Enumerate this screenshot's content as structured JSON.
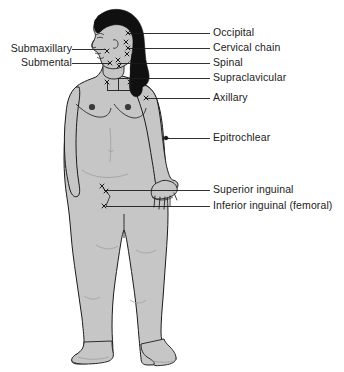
{
  "figure": {
    "background_color": "#ffffff",
    "skin_fill_color": "#c6c6c6",
    "hair_fill_color": "#101010",
    "outline_color": "#1b1b1b",
    "leader_line_color": "#1b1b1b",
    "label_text_color": "#1b1b1b"
  },
  "labels": {
    "right": [
      {
        "text": "Occipital",
        "x": 213,
        "y": 33,
        "line_from_x": 200,
        "line_to_x": 128
      },
      {
        "text": "Cervical chain",
        "x": 213,
        "y": 48,
        "line_from_x": 200,
        "line_to_x": 128
      },
      {
        "text": "Spinal",
        "x": 213,
        "y": 63,
        "line_from_x": 200,
        "line_to_x": 118
      },
      {
        "text": "Supraclavicular",
        "x": 213,
        "y": 78,
        "line_from_x": 200,
        "line_to_x": 107
      },
      {
        "text": "Axillary",
        "x": 213,
        "y": 98,
        "line_from_x": 200,
        "line_to_x": 146
      },
      {
        "text": "Epitrochlear",
        "x": 213,
        "y": 138,
        "line_from_x": 200,
        "line_to_x": 166
      },
      {
        "text": "Superior inguinal",
        "x": 213,
        "y": 190,
        "line_from_x": 200,
        "line_to_x": 102
      },
      {
        "text": "Inferior inguinal (femoral)",
        "x": 213,
        "y": 206,
        "line_from_x": 200,
        "line_to_x": 104
      }
    ],
    "left": [
      {
        "text": "Submaxillary",
        "x": 3,
        "y": 49,
        "line_from_x": 72,
        "line_to_x": 106
      },
      {
        "text": "Submental",
        "x": 3,
        "y": 63,
        "line_from_x": 72,
        "line_to_x": 109
      }
    ]
  },
  "node_markers": [
    {
      "name": "occipital-node",
      "x": 128,
      "y": 33
    },
    {
      "name": "cervical-node-1",
      "x": 126,
      "y": 42
    },
    {
      "name": "cervical-node-2",
      "x": 128,
      "y": 48
    },
    {
      "name": "cervical-node-3",
      "x": 127,
      "y": 54
    },
    {
      "name": "spinal-node-1",
      "x": 118,
      "y": 60
    },
    {
      "name": "spinal-node-2",
      "x": 119,
      "y": 66
    },
    {
      "name": "submaxillary-node",
      "x": 107,
      "y": 51
    },
    {
      "name": "submental-node",
      "x": 110,
      "y": 63
    },
    {
      "name": "supraclavicular-node-left",
      "x": 107,
      "y": 82
    },
    {
      "name": "supraclavicular-node-right",
      "x": 130,
      "y": 82
    },
    {
      "name": "axillary-node",
      "x": 146,
      "y": 98
    },
    {
      "name": "epitrochlear-node",
      "x": 166,
      "y": 138
    },
    {
      "name": "superior-inguinal-node-1",
      "x": 102,
      "y": 186
    },
    {
      "name": "superior-inguinal-node-2",
      "x": 106,
      "y": 191
    },
    {
      "name": "inferior-inguinal-node",
      "x": 104,
      "y": 206
    }
  ]
}
